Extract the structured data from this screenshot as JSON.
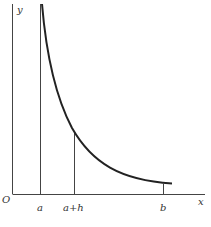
{
  "diagram": {
    "type": "function-graph",
    "axes": {
      "x_label": "x",
      "y_label": "y",
      "origin_label": "O"
    },
    "markers": [
      {
        "label": "a"
      },
      {
        "label": "a+h"
      },
      {
        "label": "b"
      }
    ],
    "colors": {
      "axis": "#444444",
      "curve": "#222222",
      "background": "#ffffff"
    }
  }
}
